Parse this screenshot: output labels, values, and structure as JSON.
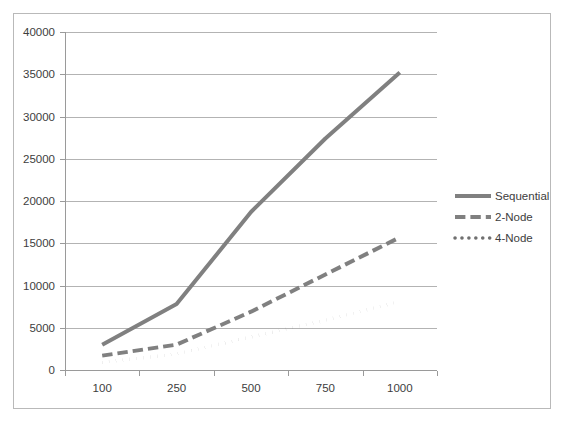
{
  "figure": {
    "background_color": "#ffffff",
    "frame_color": "#b9b9b9",
    "plot_background": "#ffffff"
  },
  "chart_data": {
    "type": "line",
    "title": "",
    "subtitle": "",
    "xlabel": "",
    "ylabel": "",
    "categories": [
      "100",
      "250",
      "500",
      "750",
      "1000"
    ],
    "x": [
      100,
      250,
      500,
      750,
      1000
    ],
    "series": [
      {
        "name": "Sequential",
        "values": [
          3000,
          7800,
          18700,
          27400,
          35200
        ],
        "color": "#808080",
        "style": "solid",
        "width": 4
      },
      {
        "name": "2-Node",
        "values": [
          1700,
          3000,
          6900,
          11300,
          15700
        ],
        "color": "#808080",
        "style": "dashed",
        "width": 4
      },
      {
        "name": "4-Node",
        "values": [
          900,
          1900,
          3900,
          5900,
          8100
        ],
        "color": "#707070",
        "style": "dotted",
        "width": 3.5
      }
    ],
    "ylim": [
      0,
      40000
    ],
    "ytick_values": [
      0,
      5000,
      10000,
      15000,
      20000,
      25000,
      30000,
      35000,
      40000
    ],
    "ytick_labels": [
      "0",
      "5000",
      "10000",
      "15000",
      "20000",
      "25000",
      "30000",
      "35000",
      "40000"
    ],
    "xtick_labels": [
      "100",
      "250",
      "500",
      "750",
      "1000"
    ],
    "grid": true,
    "grid_axis": "y",
    "grid_color": "#b3b3b3",
    "legend_position": "right",
    "legend_entries": [
      {
        "label": "Sequential",
        "style": "solid"
      },
      {
        "label": "2-Node",
        "style": "dashed"
      },
      {
        "label": "4-Node",
        "style": "dotted"
      }
    ]
  }
}
